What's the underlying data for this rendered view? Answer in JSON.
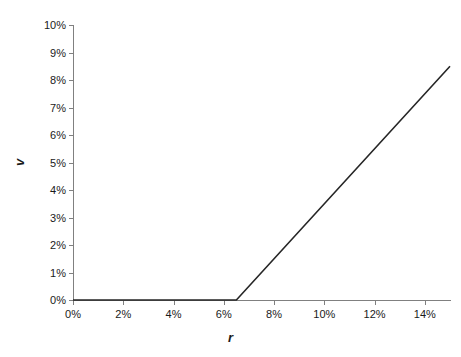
{
  "chart_data": {
    "type": "line",
    "title": "",
    "xlabel": "r",
    "ylabel": "v",
    "xlim": [
      0,
      15
    ],
    "ylim": [
      0,
      10
    ],
    "grid": false,
    "legend": "none",
    "x_tick_labels": [
      "0%",
      "2%",
      "4%",
      "6%",
      "8%",
      "10%",
      "12%",
      "14%"
    ],
    "x_tick_values": [
      0,
      2,
      4,
      6,
      8,
      10,
      12,
      14
    ],
    "y_tick_labels": [
      "0%",
      "1%",
      "2%",
      "3%",
      "4%",
      "5%",
      "6%",
      "7%",
      "8%",
      "9%",
      "10%"
    ],
    "y_tick_values": [
      0,
      1,
      2,
      3,
      4,
      5,
      6,
      7,
      8,
      9,
      10
    ],
    "x_minor_ticks": [
      1,
      3,
      5,
      7,
      9,
      11,
      13,
      15
    ],
    "series": [
      {
        "name": "v",
        "color": "#262626",
        "width": 1.6,
        "x": [
          0.0,
          6.5,
          15.0
        ],
        "y": [
          0.0,
          0.0,
          8.5
        ]
      }
    ],
    "annotations": []
  },
  "axis_colors": {
    "axis_line": "#808080",
    "tick": "#808080",
    "text": "#1a1a1a",
    "background": "#ffffff"
  }
}
